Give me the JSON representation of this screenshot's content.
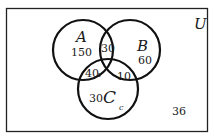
{
  "diagram": {
    "type": "venn",
    "universe_label": "U",
    "sets": [
      {
        "name": "A",
        "label": "A"
      },
      {
        "name": "B",
        "label": "B"
      },
      {
        "name": "C",
        "label": "C"
      }
    ],
    "regions": {
      "A_only": "150",
      "B_only": "60",
      "C_only": "30",
      "A_and_B": "30",
      "A_and_C": "40",
      "B_and_C": "10",
      "outside": "36"
    },
    "annotations": {
      "A_and_C_var": "z",
      "C_var": "c"
    },
    "colors": {
      "stroke": "#111111",
      "background": "#ffffff"
    }
  }
}
